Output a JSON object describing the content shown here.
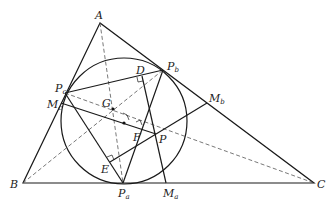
{
  "diagram": {
    "type": "geometry",
    "points": {
      "A": {
        "label": "A",
        "sub": "",
        "x": 100,
        "y": 23
      },
      "B": {
        "label": "B",
        "sub": "",
        "x": 23,
        "y": 183
      },
      "C": {
        "label": "C",
        "sub": "",
        "x": 314,
        "y": 183
      },
      "Pa": {
        "label": "P",
        "sub": "a",
        "x": 123,
        "y": 183
      },
      "Pb": {
        "label": "P",
        "sub": "b",
        "x": 163,
        "y": 70
      },
      "Pc": {
        "label": "P",
        "sub": "c",
        "x": 65,
        "y": 93
      },
      "Ma": {
        "label": "M",
        "sub": "a",
        "x": 166,
        "y": 183
      },
      "Mb": {
        "label": "M",
        "sub": "b",
        "x": 207,
        "y": 103
      },
      "Mc": {
        "label": "M",
        "sub": "c",
        "x": 61,
        "y": 103
      },
      "G": {
        "label": "G",
        "sub": "",
        "x": 113,
        "y": 109
      },
      "D": {
        "label": "D",
        "sub": "",
        "x": 142,
        "y": 76
      },
      "E": {
        "label": "E",
        "sub": "",
        "x": 110,
        "y": 162
      },
      "F": {
        "label": "F",
        "sub": "",
        "x": 140,
        "y": 126
      },
      "P": {
        "label": "P",
        "sub": "",
        "x": 156,
        "y": 134
      }
    },
    "circle": {
      "cx": 124,
      "cy": 121,
      "r": 63
    },
    "solid_segments": [
      [
        "A",
        "B"
      ],
      [
        "B",
        "C"
      ],
      [
        "C",
        "A"
      ],
      [
        "Pc",
        "Pb"
      ],
      [
        "Pc",
        "Pa"
      ],
      [
        "Pb",
        "Pa"
      ],
      [
        "Mc",
        "P"
      ],
      [
        "E",
        "Mb"
      ],
      [
        "D",
        "Ma"
      ]
    ],
    "dashed_segments": [
      [
        "A",
        "Pa"
      ],
      [
        "B",
        "Pb"
      ],
      [
        "Pc",
        "C"
      ]
    ],
    "right_angles": [
      "D",
      "E",
      "F"
    ]
  }
}
